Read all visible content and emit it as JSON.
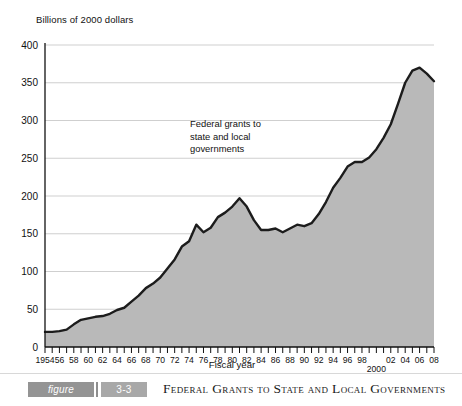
{
  "chart_data": {
    "type": "area",
    "title": "",
    "ylabel": "Billions of 2000 dollars",
    "xlabel": "Fiscal year",
    "ylim": [
      0,
      400
    ],
    "xlim": [
      1954,
      2008
    ],
    "grid": true,
    "legend": "none",
    "annotation": [
      "Federal grants to",
      "state and local",
      "governments"
    ],
    "ytick_labels": [
      "400",
      "350",
      "300",
      "250",
      "200",
      "150",
      "100",
      "50",
      "0"
    ],
    "ytick_values": [
      400,
      350,
      300,
      250,
      200,
      150,
      100,
      50,
      0
    ],
    "xtick_labels": [
      "1954",
      "56",
      "58",
      "60",
      "62",
      "64",
      "66",
      "68",
      "70",
      "72",
      "74",
      "76",
      "78",
      "80",
      "82",
      "84",
      "86",
      "88",
      "90",
      "92",
      "94",
      "96",
      "98",
      "2000",
      "02",
      "04",
      "06",
      "08"
    ],
    "xtick_values": [
      1954,
      1956,
      1958,
      1960,
      1962,
      1964,
      1966,
      1968,
      1970,
      1972,
      1974,
      1976,
      1978,
      1980,
      1982,
      1984,
      1986,
      1988,
      1990,
      1992,
      1994,
      1996,
      1998,
      2000,
      2002,
      2004,
      2006,
      2008
    ],
    "series_name": "Federal grants to state and local governments",
    "x": [
      1954,
      1955,
      1956,
      1957,
      1958,
      1959,
      1960,
      1961,
      1962,
      1963,
      1964,
      1965,
      1966,
      1967,
      1968,
      1969,
      1970,
      1971,
      1972,
      1973,
      1974,
      1975,
      1976,
      1977,
      1978,
      1979,
      1980,
      1981,
      1982,
      1983,
      1984,
      1985,
      1986,
      1987,
      1988,
      1989,
      1990,
      1991,
      1992,
      1993,
      1994,
      1995,
      1996,
      1997,
      1998,
      1999,
      2000,
      2001,
      2002,
      2003,
      2004,
      2005,
      2006,
      2007,
      2008
    ],
    "values": [
      20,
      20,
      21,
      23,
      30,
      36,
      38,
      40,
      41,
      44,
      49,
      52,
      60,
      68,
      78,
      84,
      92,
      104,
      116,
      133,
      140,
      162,
      152,
      158,
      172,
      178,
      186,
      197,
      186,
      168,
      155,
      155,
      157,
      152,
      157,
      162,
      160,
      164,
      176,
      192,
      211,
      224,
      239,
      245,
      245,
      251,
      262,
      277,
      295,
      322,
      350,
      366,
      370,
      362,
      352
    ]
  },
  "caption": {
    "figure_label": "figure",
    "figure_number": "3-3",
    "title": "Federal Grants to State and Local Governments"
  }
}
